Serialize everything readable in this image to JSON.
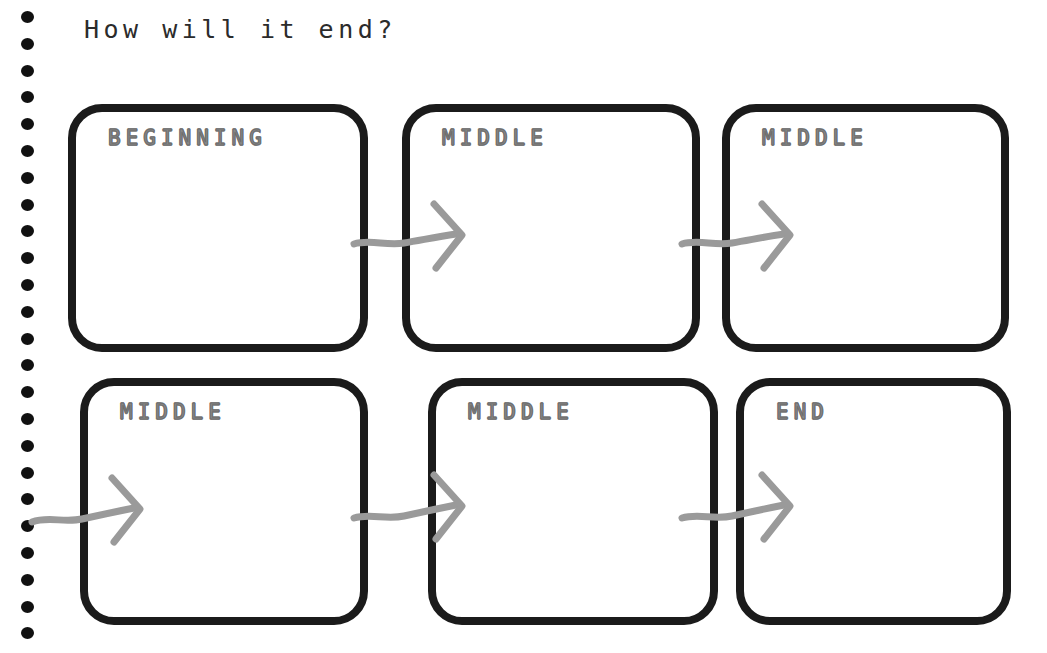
{
  "page": {
    "title": "How will it end?",
    "background_color": "#ffffff",
    "ink_color": "#1b1b1b",
    "arrow_color": "#9a9a9a",
    "label_color": "#8a8a8a",
    "binding_hole_count": 24
  },
  "storyboard": {
    "rows": [
      {
        "cells": [
          {
            "label": "BEGINNING",
            "content": ""
          },
          {
            "label": "MIDDLE",
            "content": ""
          },
          {
            "label": "MIDDLE",
            "content": ""
          }
        ]
      },
      {
        "cells": [
          {
            "label": "MIDDLE",
            "content": ""
          },
          {
            "label": "MIDDLE",
            "content": ""
          },
          {
            "label": "END",
            "content": ""
          }
        ]
      }
    ],
    "connectors": [
      {
        "name": "arrow-1-to-2"
      },
      {
        "name": "arrow-2-to-3"
      },
      {
        "name": "arrow-wrap-to-4"
      },
      {
        "name": "arrow-4-to-5"
      },
      {
        "name": "arrow-5-to-6"
      }
    ]
  }
}
